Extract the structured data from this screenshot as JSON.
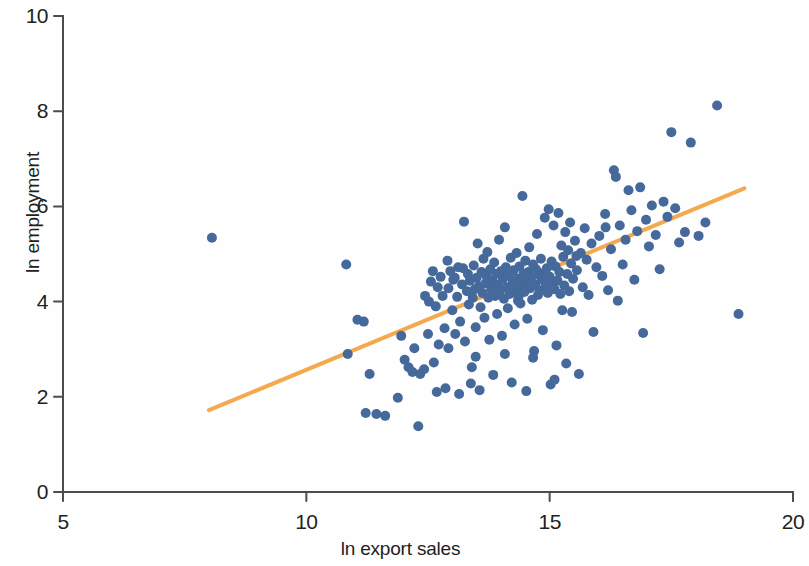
{
  "chart_data": {
    "type": "scatter",
    "title": "",
    "xlabel": "ln export sales",
    "ylabel": "ln employment",
    "xlim": [
      5,
      20
    ],
    "ylim": [
      0,
      10
    ],
    "xticks": [
      5,
      10,
      15,
      20
    ],
    "yticks": [
      0,
      2,
      4,
      6,
      8,
      10
    ],
    "grid": false,
    "legend": null,
    "marker_color": "#45699b",
    "marker_size": 10,
    "axis_color": "#4d4d4d",
    "background_color": "#ffffff",
    "series": [
      {
        "name": "firms",
        "type": "scatter",
        "points": [
          [
            8.06,
            5.34
          ],
          [
            10.82,
            4.78
          ],
          [
            10.85,
            2.9
          ],
          [
            11.05,
            3.62
          ],
          [
            11.18,
            3.58
          ],
          [
            11.3,
            2.48
          ],
          [
            11.22,
            1.66
          ],
          [
            11.44,
            1.64
          ],
          [
            11.62,
            1.6
          ],
          [
            11.95,
            3.28
          ],
          [
            12.02,
            2.78
          ],
          [
            12.1,
            2.62
          ],
          [
            12.18,
            2.52
          ],
          [
            12.22,
            3.02
          ],
          [
            12.3,
            1.38
          ],
          [
            12.34,
            2.48
          ],
          [
            12.42,
            2.58
          ],
          [
            12.5,
            3.32
          ],
          [
            12.52,
            4.0
          ],
          [
            12.56,
            4.42
          ],
          [
            12.6,
            4.64
          ],
          [
            12.62,
            2.72
          ],
          [
            12.66,
            3.9
          ],
          [
            12.7,
            4.3
          ],
          [
            12.72,
            3.1
          ],
          [
            12.76,
            4.52
          ],
          [
            12.8,
            4.12
          ],
          [
            12.84,
            3.44
          ],
          [
            12.86,
            2.18
          ],
          [
            12.9,
            4.86
          ],
          [
            12.92,
            4.28
          ],
          [
            12.96,
            4.64
          ],
          [
            13.0,
            3.82
          ],
          [
            13.02,
            4.46
          ],
          [
            13.06,
            3.32
          ],
          [
            13.1,
            4.1
          ],
          [
            13.12,
            4.72
          ],
          [
            13.14,
            2.06
          ],
          [
            13.16,
            3.58
          ],
          [
            13.2,
            4.36
          ],
          [
            13.22,
            4.7
          ],
          [
            13.24,
            5.68
          ],
          [
            13.26,
            3.16
          ],
          [
            13.3,
            4.22
          ],
          [
            13.32,
            4.58
          ],
          [
            13.34,
            3.94
          ],
          [
            13.36,
            4.44
          ],
          [
            13.4,
            2.62
          ],
          [
            13.42,
            4.08
          ],
          [
            13.44,
            4.76
          ],
          [
            13.46,
            4.26
          ],
          [
            13.48,
            3.46
          ],
          [
            13.5,
            4.5
          ],
          [
            13.52,
            5.22
          ],
          [
            13.54,
            4.32
          ],
          [
            13.56,
            2.14
          ],
          [
            13.58,
            3.88
          ],
          [
            13.6,
            4.62
          ],
          [
            13.62,
            4.18
          ],
          [
            13.64,
            4.9
          ],
          [
            13.66,
            3.66
          ],
          [
            13.68,
            4.38
          ],
          [
            13.7,
            4.54
          ],
          [
            13.72,
            5.04
          ],
          [
            13.74,
            4.08
          ],
          [
            13.76,
            3.2
          ],
          [
            13.78,
            4.68
          ],
          [
            13.8,
            4.26
          ],
          [
            13.82,
            4.44
          ],
          [
            13.84,
            2.46
          ],
          [
            13.86,
            4.82
          ],
          [
            13.88,
            4.12
          ],
          [
            13.9,
            4.58
          ],
          [
            13.92,
            3.74
          ],
          [
            13.94,
            4.36
          ],
          [
            13.96,
            5.3
          ],
          [
            13.98,
            4.22
          ],
          [
            14.0,
            4.64
          ],
          [
            14.02,
            3.28
          ],
          [
            14.04,
            4.48
          ],
          [
            14.06,
            4.06
          ],
          [
            14.08,
            5.56
          ],
          [
            14.1,
            4.72
          ],
          [
            14.12,
            4.3
          ],
          [
            14.14,
            3.86
          ],
          [
            14.16,
            4.54
          ],
          [
            14.18,
            4.16
          ],
          [
            14.2,
            4.92
          ],
          [
            14.22,
            2.3
          ],
          [
            14.24,
            4.4
          ],
          [
            14.26,
            4.66
          ],
          [
            14.28,
            3.52
          ],
          [
            14.3,
            4.24
          ],
          [
            14.32,
            5.02
          ],
          [
            14.34,
            4.48
          ],
          [
            14.36,
            4.1
          ],
          [
            14.38,
            4.74
          ],
          [
            14.4,
            3.96
          ],
          [
            14.42,
            4.34
          ],
          [
            14.44,
            6.22
          ],
          [
            14.46,
            4.58
          ],
          [
            14.48,
            4.2
          ],
          [
            14.5,
            4.86
          ],
          [
            14.52,
            4.42
          ],
          [
            14.54,
            3.64
          ],
          [
            14.56,
            4.62
          ],
          [
            14.58,
            5.14
          ],
          [
            14.6,
            4.28
          ],
          [
            14.62,
            4.5
          ],
          [
            14.64,
            4.04
          ],
          [
            14.66,
            4.78
          ],
          [
            14.68,
            2.96
          ],
          [
            14.7,
            4.36
          ],
          [
            14.72,
            4.68
          ],
          [
            14.74,
            5.42
          ],
          [
            14.76,
            4.14
          ],
          [
            14.78,
            4.56
          ],
          [
            14.8,
            4.24
          ],
          [
            14.82,
            4.9
          ],
          [
            14.84,
            4.46
          ],
          [
            14.86,
            3.4
          ],
          [
            14.88,
            4.6
          ],
          [
            14.9,
            5.76
          ],
          [
            14.92,
            4.32
          ],
          [
            14.94,
            4.7
          ],
          [
            14.96,
            4.18
          ],
          [
            14.98,
            5.94
          ],
          [
            15.0,
            4.52
          ],
          [
            15.02,
            2.26
          ],
          [
            15.04,
            4.84
          ],
          [
            15.06,
            4.38
          ],
          [
            15.08,
            5.6
          ],
          [
            15.1,
            4.26
          ],
          [
            15.12,
            4.74
          ],
          [
            15.14,
            3.08
          ],
          [
            15.16,
            4.44
          ],
          [
            15.18,
            5.86
          ],
          [
            15.2,
            4.62
          ],
          [
            15.22,
            4.16
          ],
          [
            15.24,
            5.18
          ],
          [
            15.26,
            3.82
          ],
          [
            15.28,
            4.94
          ],
          [
            15.3,
            4.34
          ],
          [
            15.32,
            5.46
          ],
          [
            15.34,
            2.7
          ],
          [
            15.36,
            4.58
          ],
          [
            15.38,
            5.08
          ],
          [
            15.4,
            4.22
          ],
          [
            15.42,
            5.66
          ],
          [
            15.44,
            4.8
          ],
          [
            15.46,
            3.78
          ],
          [
            15.48,
            4.48
          ],
          [
            15.52,
            5.28
          ],
          [
            15.56,
            4.66
          ],
          [
            15.6,
            2.48
          ],
          [
            15.64,
            5.02
          ],
          [
            15.68,
            4.3
          ],
          [
            15.72,
            5.54
          ],
          [
            15.76,
            4.88
          ],
          [
            15.8,
            4.14
          ],
          [
            15.86,
            5.22
          ],
          [
            15.9,
            3.36
          ],
          [
            15.96,
            4.72
          ],
          [
            16.02,
            5.38
          ],
          [
            16.08,
            4.54
          ],
          [
            16.14,
            5.84
          ],
          [
            16.2,
            4.24
          ],
          [
            16.26,
            5.1
          ],
          [
            16.32,
            6.76
          ],
          [
            16.36,
            6.62
          ],
          [
            16.4,
            4.02
          ],
          [
            16.44,
            5.6
          ],
          [
            16.5,
            4.78
          ],
          [
            16.56,
            5.3
          ],
          [
            16.62,
            6.34
          ],
          [
            16.68,
            5.92
          ],
          [
            16.74,
            4.46
          ],
          [
            16.8,
            5.48
          ],
          [
            16.86,
            6.4
          ],
          [
            16.92,
            3.34
          ],
          [
            16.98,
            5.72
          ],
          [
            17.04,
            5.16
          ],
          [
            17.1,
            6.02
          ],
          [
            17.18,
            5.4
          ],
          [
            17.26,
            4.68
          ],
          [
            17.34,
            6.1
          ],
          [
            17.42,
            5.78
          ],
          [
            17.5,
            7.56
          ],
          [
            17.58,
            5.96
          ],
          [
            17.66,
            5.24
          ],
          [
            17.78,
            5.46
          ],
          [
            17.9,
            7.34
          ],
          [
            18.06,
            5.38
          ],
          [
            18.2,
            5.66
          ],
          [
            18.44,
            8.12
          ],
          [
            18.88,
            3.74
          ],
          [
            12.44,
            4.12
          ],
          [
            13.05,
            4.5
          ],
          [
            13.77,
            4.42
          ],
          [
            14.35,
            4.02
          ],
          [
            14.95,
            4.4
          ],
          [
            15.55,
            4.96
          ],
          [
            16.15,
            5.56
          ],
          [
            12.92,
            3.02
          ],
          [
            13.48,
            2.84
          ],
          [
            14.08,
            2.9
          ],
          [
            14.66,
            2.82
          ],
          [
            13.38,
            2.28
          ],
          [
            14.52,
            2.12
          ],
          [
            15.1,
            2.36
          ],
          [
            12.68,
            2.1
          ],
          [
            11.88,
            1.98
          ]
        ]
      }
    ],
    "fit_line": {
      "name": "linear fit",
      "color": "#f5a94e",
      "width": 4,
      "x_start": 8.0,
      "y_start": 1.72,
      "x_end": 19.0,
      "y_end": 6.38
    }
  },
  "axes": {
    "y_tick_labels": [
      "10",
      "8",
      "6",
      "4",
      "2",
      "0"
    ],
    "x_tick_labels": [
      "5",
      "10",
      "15",
      "20"
    ],
    "y_axis_title": "ln employment",
    "x_axis_title": "ln export sales"
  }
}
